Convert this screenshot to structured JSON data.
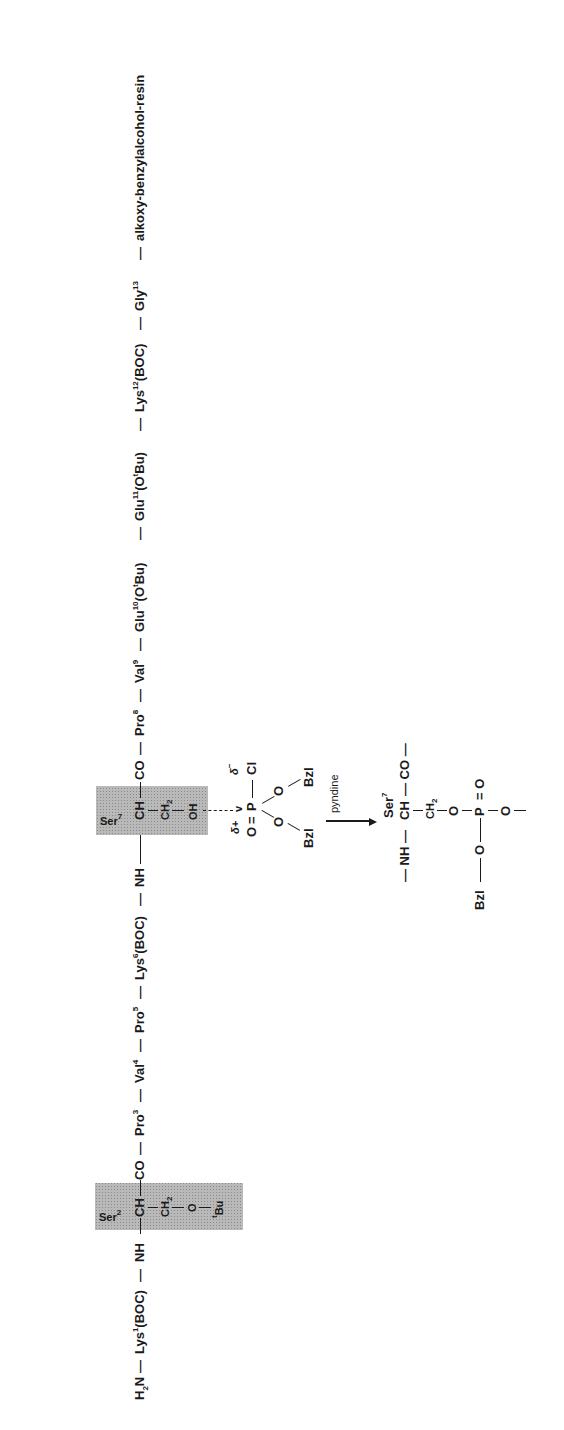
{
  "orientation": "rotated 90° counter-clockwise",
  "main_chain": {
    "segments": [
      {
        "id": "h2n",
        "text": "H",
        "sub": "2",
        "after": "N"
      },
      {
        "id": "lys1",
        "residue": "Lys",
        "number": "1",
        "suffix": "(BOC)"
      },
      {
        "id": "nh1",
        "text": "NH"
      },
      {
        "id": "co1",
        "text": "CO"
      },
      {
        "id": "pro3",
        "residue": "Pro",
        "number": "3"
      },
      {
        "id": "val4",
        "residue": "Val",
        "number": "4"
      },
      {
        "id": "pro5",
        "residue": "Pro",
        "number": "5"
      },
      {
        "id": "lys6",
        "residue": "Lys",
        "number": "6",
        "suffix": "(BOC)"
      },
      {
        "id": "nh2",
        "text": "NH"
      },
      {
        "id": "co2",
        "text": "CO"
      },
      {
        "id": "pro8",
        "residue": "Pro",
        "number": "8"
      },
      {
        "id": "val9",
        "residue": "Val",
        "number": "9"
      },
      {
        "id": "glu10",
        "residue": "Glu",
        "number": "10",
        "suffix_pre": "(O",
        "suffix_sup": "t",
        "suffix_post": "Bu)"
      },
      {
        "id": "glu11",
        "residue": "Glu",
        "number": "11",
        "suffix_pre": "(O",
        "suffix_sup": "t",
        "suffix_post": "Bu)"
      },
      {
        "id": "lys12",
        "residue": "Lys",
        "number": "12",
        "suffix": "(BOC)"
      },
      {
        "id": "gly13",
        "residue": "Gly",
        "number": "13"
      },
      {
        "id": "resin",
        "text": "alkoxy-benzylalcohol-resin"
      }
    ],
    "bond_symbol": "—"
  },
  "ser2_box": {
    "label": "Ser",
    "number": "2",
    "alpha": "CH",
    "side_chain": [
      "CH",
      "2",
      "O",
      "t",
      "Bu"
    ]
  },
  "ser7_box": {
    "label": "Ser",
    "number": "7",
    "alpha": "CH",
    "ch2": "CH",
    "ch2_sub": "2",
    "oh": "OH"
  },
  "reagent": {
    "o_double": "O",
    "equals": "=",
    "p": "P",
    "cl": "Cl",
    "delta_plus": "δ+",
    "delta_minus": "δ",
    "delta_minus_sup": "−",
    "attack_mark": "v",
    "o1": "O",
    "o2": "O",
    "bzl1": "Bzl",
    "bzl2": "Bzl"
  },
  "arrow": {
    "reagent_label": "pyndine"
  },
  "product": {
    "label": "Ser",
    "number": "7",
    "nh": "— NH —",
    "ch": "CH",
    "co": "— CO —",
    "ch2": "CH",
    "ch2_sub": "2",
    "o_link": "O",
    "p": "P",
    "p_double_o": "O",
    "o_bzl": "O",
    "bzl": "Bzl",
    "o_minus": "O",
    "dash": "—"
  }
}
